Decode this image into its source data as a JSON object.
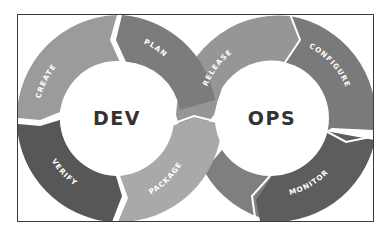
{
  "diagram": {
    "hubs": {
      "dev": {
        "label": "DEV"
      },
      "ops": {
        "label": "OPS"
      }
    },
    "segments": {
      "create": {
        "label": "CREATE",
        "color": "#9b9b9b"
      },
      "plan": {
        "label": "PLAN",
        "color": "#7c7c7c"
      },
      "verify": {
        "label": "VERIFY",
        "color": "#575757"
      },
      "package": {
        "label": "PACKAGE",
        "color": "#a9a9a9"
      },
      "release": {
        "label": "RELEASE",
        "color": "#969696"
      },
      "configure": {
        "label": "CONFIGURE",
        "color": "#7a7a7a"
      },
      "monitor": {
        "label": "MONITOR",
        "color": "#5d5d5d"
      },
      "ops_lower": {
        "label": "",
        "color": "#7f7f7f"
      }
    },
    "colors": {
      "frame_border": "#3a3a3a",
      "separator": "#ffffff",
      "hub_text": "#333333",
      "background": "#ffffff"
    }
  }
}
